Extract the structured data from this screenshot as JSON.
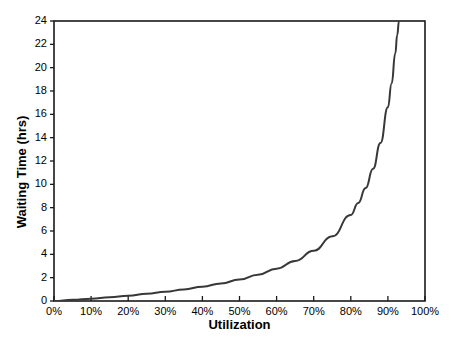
{
  "chart_data": {
    "type": "line",
    "title": "",
    "xlabel": "Utilization",
    "ylabel": "Waiting Time (hrs)",
    "xlim": [
      0,
      100
    ],
    "ylim": [
      0,
      24
    ],
    "grid": false,
    "legend": false,
    "x_tick_labels": [
      "0%",
      "10%",
      "20%",
      "30%",
      "40%",
      "50%",
      "60%",
      "70%",
      "80%",
      "90%",
      "100%"
    ],
    "x_tick_values": [
      0,
      10,
      20,
      30,
      40,
      50,
      60,
      70,
      80,
      90,
      100
    ],
    "y_tick_labels": [
      "0",
      "2",
      "4",
      "6",
      "8",
      "10",
      "12",
      "14",
      "16",
      "18",
      "20",
      "22",
      "24"
    ],
    "y_tick_values": [
      0,
      2,
      4,
      6,
      8,
      10,
      12,
      14,
      16,
      18,
      20,
      22,
      24
    ],
    "series": [
      {
        "name": "Waiting Time",
        "color": "#383838",
        "line_width": 2,
        "x": [
          0,
          5,
          10,
          15,
          20,
          25,
          30,
          35,
          40,
          45,
          50,
          55,
          60,
          65,
          70,
          75,
          80,
          82,
          84,
          86,
          88,
          90,
          91,
          92,
          92.5,
          93
        ],
        "values": [
          0,
          0.1,
          0.2,
          0.33,
          0.46,
          0.62,
          0.79,
          0.99,
          1.23,
          1.51,
          1.84,
          2.26,
          2.77,
          3.43,
          4.31,
          5.54,
          7.38,
          8.4,
          9.68,
          11.33,
          13.54,
          16.61,
          18.65,
          21.23,
          22.79,
          24.0
        ]
      }
    ],
    "axis_color": "#1a1a1a",
    "background": "#ffffff"
  }
}
